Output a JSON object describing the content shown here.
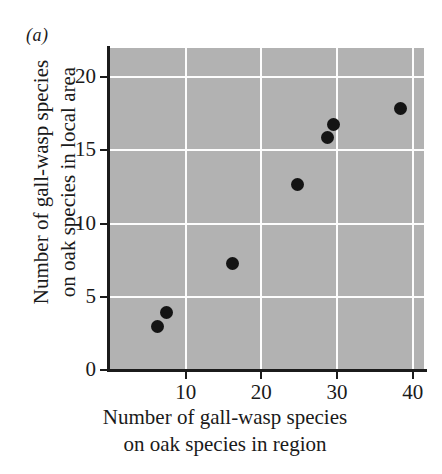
{
  "panel": {
    "label": "(a)"
  },
  "chart_data": {
    "type": "scatter",
    "title": "",
    "xlabel": "Number of gall-wasp species on oak species in region",
    "xlabel_lines": [
      "Number of gall-wasp species",
      "on oak species in region"
    ],
    "ylabel": "Number of gall-wasp species on oak species in local area",
    "ylabel_lines": [
      "Number of gall-wasp species",
      "on oak species in local area"
    ],
    "xlim": [
      0,
      41.5
    ],
    "ylim": [
      0,
      22.0
    ],
    "xticks": [
      10,
      20,
      30,
      40
    ],
    "yticks": [
      0,
      5,
      10,
      15,
      20
    ],
    "xticklabels": [
      "10",
      "20",
      "30",
      "40"
    ],
    "yticklabels": [
      "0",
      "5",
      "10",
      "15",
      "20"
    ],
    "grid": true,
    "grid_color": "#fdfdfd",
    "plot_background": "#b2b2b2",
    "marker_color": "#141414",
    "legend": null,
    "points": [
      {
        "x": 6.3,
        "y": 3.0
      },
      {
        "x": 7.5,
        "y": 3.9
      },
      {
        "x": 16.2,
        "y": 7.3
      },
      {
        "x": 24.8,
        "y": 12.7
      },
      {
        "x": 28.7,
        "y": 15.9
      },
      {
        "x": 29.6,
        "y": 16.8
      },
      {
        "x": 38.4,
        "y": 17.9
      }
    ]
  }
}
